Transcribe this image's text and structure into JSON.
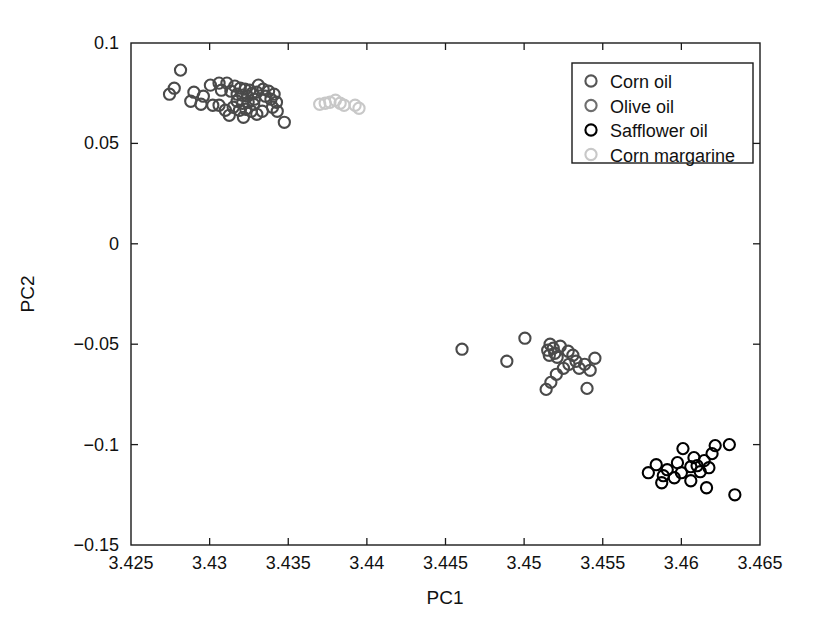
{
  "chart_data": {
    "type": "scatter",
    "title": "",
    "xlabel": "PC1",
    "ylabel": "PC2",
    "xlim": [
      3.425,
      3.465
    ],
    "ylim": [
      -0.15,
      0.1
    ],
    "xticks": [
      3.425,
      3.43,
      3.435,
      3.44,
      3.445,
      3.45,
      3.455,
      3.46,
      3.465
    ],
    "xtick_labels": [
      "3.425",
      "3.43",
      "3.435",
      "3.44",
      "3.445",
      "3.45",
      "3.455",
      "3.46",
      "3.465"
    ],
    "yticks": [
      0.1,
      0.05,
      0,
      -0.05,
      -0.1,
      -0.15
    ],
    "ytick_labels": [
      "0.1",
      "0.05",
      "0",
      "-0.05",
      "-0.1",
      "-0.15"
    ],
    "grid": false,
    "legend_position": "top-right",
    "marker": "open-circle",
    "series": [
      {
        "name": "Corn oil",
        "color": "#4a4a4a",
        "points": [
          [
            3.42815,
            0.0865
          ],
          [
            3.42775,
            0.0775
          ],
          [
            3.42745,
            0.0745
          ],
          [
            3.4288,
            0.071
          ],
          [
            3.42945,
            0.0695
          ],
          [
            3.4302,
            0.069
          ],
          [
            3.43005,
            0.079
          ],
          [
            3.4306,
            0.08
          ],
          [
            3.43075,
            0.0765
          ],
          [
            3.4311,
            0.08
          ],
          [
            3.43135,
            0.076
          ],
          [
            3.4316,
            0.0785
          ],
          [
            3.43175,
            0.0745
          ],
          [
            3.43195,
            0.0775
          ],
          [
            3.4321,
            0.074
          ],
          [
            3.43225,
            0.077
          ],
          [
            3.4324,
            0.0735
          ],
          [
            3.43255,
            0.0765
          ],
          [
            3.4327,
            0.075
          ],
          [
            3.43285,
            0.072
          ],
          [
            3.433,
            0.0755
          ],
          [
            3.43175,
            0.071
          ],
          [
            3.4321,
            0.07
          ],
          [
            3.43245,
            0.0705
          ],
          [
            3.4328,
            0.0695
          ],
          [
            3.4315,
            0.068
          ],
          [
            3.4319,
            0.0665
          ],
          [
            3.4323,
            0.067
          ],
          [
            3.43265,
            0.066
          ],
          [
            3.431,
            0.0665
          ],
          [
            3.4306,
            0.069
          ],
          [
            3.4331,
            0.079
          ],
          [
            3.4334,
            0.077
          ],
          [
            3.43355,
            0.0735
          ],
          [
            3.43375,
            0.076
          ],
          [
            3.4339,
            0.072
          ],
          [
            3.4341,
            0.0745
          ],
          [
            3.43425,
            0.0705
          ],
          [
            3.433,
            0.0645
          ],
          [
            3.43335,
            0.066
          ],
          [
            3.43125,
            0.064
          ],
          [
            3.43215,
            0.063
          ],
          [
            3.434,
            0.068
          ],
          [
            3.4343,
            0.066
          ],
          [
            3.43475,
            0.0605
          ],
          [
            3.429,
            0.0755
          ],
          [
            3.4296,
            0.0735
          ]
        ]
      },
      {
        "name": "Olive oil",
        "color": "#4a4a4a",
        "points": [
          [
            3.44605,
            -0.0525
          ],
          [
            3.4489,
            -0.0585
          ],
          [
            3.45005,
            -0.047
          ],
          [
            3.45165,
            -0.05
          ],
          [
            3.45185,
            -0.052
          ],
          [
            3.4515,
            -0.053
          ],
          [
            3.45195,
            -0.0545
          ],
          [
            3.4516,
            -0.0555
          ],
          [
            3.4521,
            -0.0565
          ],
          [
            3.4523,
            -0.051
          ],
          [
            3.4528,
            -0.0535
          ],
          [
            3.4531,
            -0.0555
          ],
          [
            3.4533,
            -0.0585
          ],
          [
            3.45285,
            -0.06
          ],
          [
            3.4525,
            -0.062
          ],
          [
            3.45205,
            -0.065
          ],
          [
            3.4517,
            -0.069
          ],
          [
            3.4514,
            -0.0725
          ],
          [
            3.4535,
            -0.062
          ],
          [
            3.45385,
            -0.06
          ],
          [
            3.4542,
            -0.063
          ],
          [
            3.4545,
            -0.057
          ],
          [
            3.454,
            -0.072
          ]
        ]
      },
      {
        "name": "Safflower oil",
        "color": "#000000",
        "points": [
          [
            3.4579,
            -0.114
          ],
          [
            3.4584,
            -0.11
          ],
          [
            3.45885,
            -0.1155
          ],
          [
            3.4591,
            -0.1125
          ],
          [
            3.45955,
            -0.1165
          ],
          [
            3.45975,
            -0.109
          ],
          [
            3.46,
            -0.114
          ],
          [
            3.4601,
            -0.102
          ],
          [
            3.4606,
            -0.111
          ],
          [
            3.4608,
            -0.1065
          ],
          [
            3.461,
            -0.1105
          ],
          [
            3.4612,
            -0.1135
          ],
          [
            3.46145,
            -0.108
          ],
          [
            3.46175,
            -0.1115
          ],
          [
            3.46195,
            -0.1045
          ],
          [
            3.46215,
            -0.1005
          ],
          [
            3.4616,
            -0.1215
          ],
          [
            3.46305,
            -0.1
          ],
          [
            3.4634,
            -0.125
          ],
          [
            3.45875,
            -0.119
          ],
          [
            3.4606,
            -0.118
          ]
        ]
      },
      {
        "name": "Corn margarine",
        "color": "#c8c8c8",
        "points": [
          [
            3.437,
            0.0695
          ],
          [
            3.43735,
            0.07
          ],
          [
            3.43765,
            0.0705
          ],
          [
            3.438,
            0.0715
          ],
          [
            3.4383,
            0.07
          ],
          [
            3.43855,
            0.069
          ],
          [
            3.43925,
            0.069
          ],
          [
            3.4395,
            0.0675
          ]
        ]
      }
    ]
  },
  "legend": {
    "entries": [
      {
        "label": "Corn oil",
        "color": "#555555"
      },
      {
        "label": "Olive oil",
        "color": "#6e6e6e"
      },
      {
        "label": "Safflower oil",
        "color": "#000000"
      },
      {
        "label": "Corn margarine",
        "color": "#c8c8c8"
      }
    ]
  }
}
